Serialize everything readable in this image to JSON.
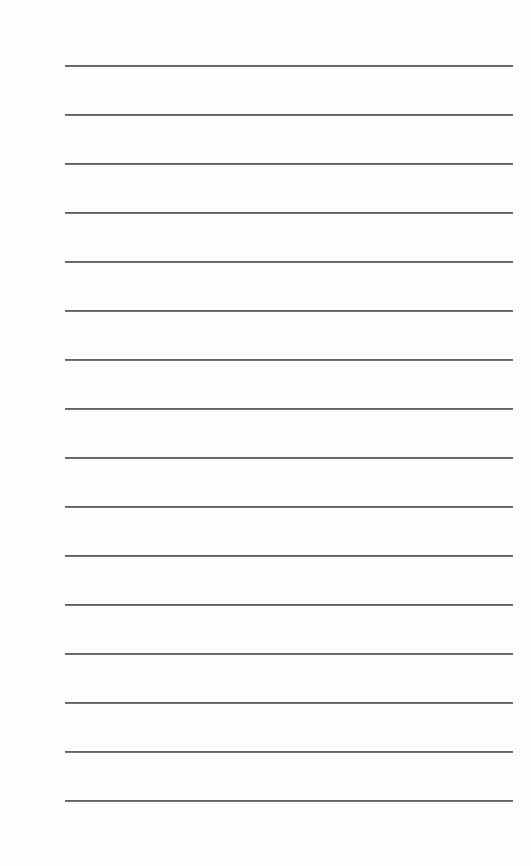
{
  "document": {
    "type": "lined-sheet",
    "background_color": "#ffffff",
    "rule_color": "#555555",
    "rule_count": 16,
    "rule_left_px": 65,
    "rule_right_px": 513,
    "first_rule_y_px": 65,
    "rule_spacing_px": 49,
    "lines": [
      {
        "index": 1,
        "text": ""
      },
      {
        "index": 2,
        "text": ""
      },
      {
        "index": 3,
        "text": ""
      },
      {
        "index": 4,
        "text": ""
      },
      {
        "index": 5,
        "text": ""
      },
      {
        "index": 6,
        "text": ""
      },
      {
        "index": 7,
        "text": ""
      },
      {
        "index": 8,
        "text": ""
      },
      {
        "index": 9,
        "text": ""
      },
      {
        "index": 10,
        "text": ""
      },
      {
        "index": 11,
        "text": ""
      },
      {
        "index": 12,
        "text": ""
      },
      {
        "index": 13,
        "text": ""
      },
      {
        "index": 14,
        "text": ""
      },
      {
        "index": 15,
        "text": ""
      },
      {
        "index": 16,
        "text": ""
      }
    ]
  }
}
